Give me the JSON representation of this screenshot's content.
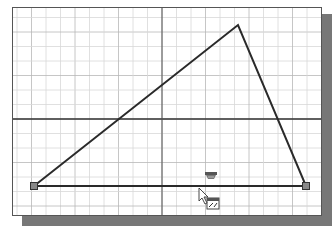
{
  "viewport": {
    "background": "#ffffff",
    "shadow_color": "#777777",
    "border_color": "#555555",
    "grid_minor_color": "#d8d8d8",
    "grid_major_color": "#b8b8b8",
    "axis_color": "#333333",
    "sketch_color": "#2a2a2a"
  },
  "grid": {
    "spacing": 14.5,
    "origin": {
      "x": 162,
      "y": 119
    }
  },
  "sketch": {
    "triangle_vertices": [
      {
        "name": "bottom-left",
        "x": 34,
        "y": 186
      },
      {
        "name": "top",
        "x": 238,
        "y": 25
      },
      {
        "name": "bottom-right",
        "x": 306,
        "y": 186
      }
    ],
    "endpoints": [
      {
        "x": 34,
        "y": 186
      },
      {
        "x": 306,
        "y": 186
      }
    ]
  },
  "constraint_glyphs": [
    {
      "name": "horizontal-constraint-icon",
      "x": 205,
      "y": 172
    },
    {
      "name": "line-tool-icon",
      "x": 207,
      "y": 198
    }
  ],
  "cursor": {
    "x": 199,
    "y": 188
  }
}
